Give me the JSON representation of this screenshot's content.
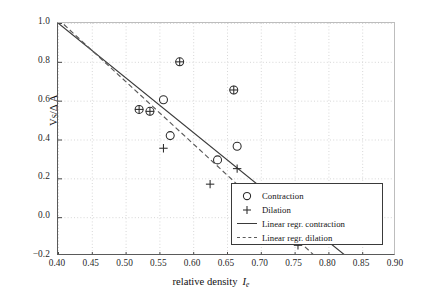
{
  "chart_data": {
    "type": "scatter",
    "title": "",
    "xlabel": "relative density  I_e",
    "xlabel_main": "relative density",
    "xlabel_symbol": "I",
    "xlabel_symbol_sub": "e",
    "ylabel": "V_S/Δ A",
    "ylabel_main": "V",
    "ylabel_sub": "S",
    "ylabel_rest": "/Δ A",
    "xlim": [
      0.4,
      0.9
    ],
    "ylim": [
      1.0,
      -0.2
    ],
    "y_inverted": true,
    "grid": true,
    "grid_style": "dotted",
    "grid_color": "#d2d2d2",
    "xticks": [
      0.4,
      0.45,
      0.5,
      0.55,
      0.6,
      0.65,
      0.7,
      0.75,
      0.8,
      0.85,
      0.9
    ],
    "xtick_labels": [
      "0.40",
      "0.45",
      "0.50",
      "0.55",
      "0.60",
      "0.65",
      "0.70",
      "0.75",
      "0.80",
      "0.85",
      "0.90"
    ],
    "yticks": [
      -0.2,
      0.0,
      0.2,
      0.4,
      0.6,
      0.8,
      1.0
    ],
    "ytick_labels": [
      "−0.2",
      "0.0",
      "0.2",
      "0.4",
      "0.6",
      "0.8",
      "1.0"
    ],
    "legend_position": "lower right",
    "series": [
      {
        "name": "Contraction",
        "marker": "circle",
        "color": "#2b2b2b",
        "points": [
          {
            "x": 0.52,
            "y": 0.555
          },
          {
            "x": 0.536,
            "y": 0.545
          },
          {
            "x": 0.556,
            "y": 0.605
          },
          {
            "x": 0.566,
            "y": 0.42
          },
          {
            "x": 0.58,
            "y": 0.8
          },
          {
            "x": 0.636,
            "y": 0.295
          },
          {
            "x": 0.66,
            "y": 0.655
          },
          {
            "x": 0.665,
            "y": 0.1
          },
          {
            "x": 0.665,
            "y": 0.365
          },
          {
            "x": 0.755,
            "y": -0.01
          },
          {
            "x": 0.755,
            "y": 0.035
          }
        ]
      },
      {
        "name": "Dilation",
        "marker": "plus",
        "color": "#2b2b2b",
        "points": [
          {
            "x": 0.52,
            "y": 0.555
          },
          {
            "x": 0.536,
            "y": 0.545
          },
          {
            "x": 0.556,
            "y": 0.355
          },
          {
            "x": 0.58,
            "y": 0.8
          },
          {
            "x": 0.625,
            "y": 0.17
          },
          {
            "x": 0.66,
            "y": 0.655
          },
          {
            "x": 0.665,
            "y": 0.055
          },
          {
            "x": 0.665,
            "y": 0.25
          },
          {
            "x": 0.755,
            "y": -0.115
          },
          {
            "x": 0.755,
            "y": -0.145
          }
        ]
      }
    ],
    "fits": [
      {
        "name": "Linear regr. contraction",
        "style": "solid",
        "color": "#3a3a3a",
        "x0": 0.4,
        "y0": 1.0,
        "x1": 0.826,
        "y1": -0.2
      },
      {
        "name": "Linear regr. dilation",
        "style": "dashed",
        "color": "#5a5a5a",
        "x0": 0.4,
        "y0": 1.02,
        "x1": 0.78,
        "y1": -0.2
      }
    ],
    "legend": [
      {
        "label": "Contraction",
        "key": "circle-marker"
      },
      {
        "label": "Dilation",
        "key": "plus-marker"
      },
      {
        "label": "Linear regr. contraction",
        "key": "solid-line"
      },
      {
        "label": "Linear regr. dilation",
        "key": "dashed-line"
      }
    ]
  }
}
